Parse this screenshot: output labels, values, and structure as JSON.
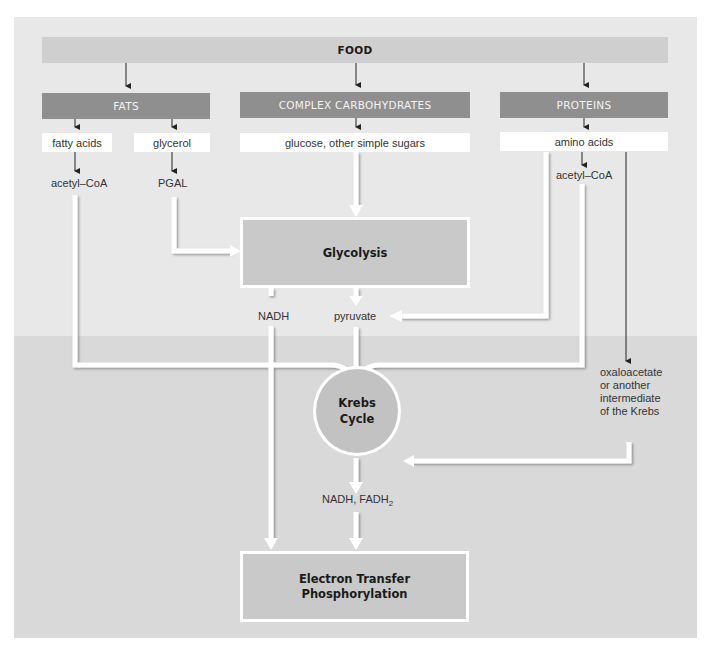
{
  "diagram": {
    "source": {
      "label": "FOOD"
    },
    "categories": [
      {
        "label": "FATS"
      },
      {
        "label": "COMPLEX CARBOHYDRATES"
      },
      {
        "label": "PROTEINS"
      }
    ],
    "breakdown_products": [
      {
        "label": "fatty acids"
      },
      {
        "label": "glycerol"
      },
      {
        "label": "glucose, other simple sugars"
      },
      {
        "label": "amino acids"
      }
    ],
    "intermediates": {
      "fat_acetyl_coa": "acetyl–CoA",
      "pgal": "PGAL",
      "protein_acetyl_coa": "acetyl–CoA",
      "nadh": "NADH",
      "pyruvate": "pyruvate",
      "oxaloacetate_lines": [
        "oxaloacetate",
        "or another",
        "intermediate",
        "of the Krebs"
      ],
      "nadh_fadh2_prefix": "NADH, FADH",
      "nadh_fadh2_sub": "2"
    },
    "processes": {
      "glycolysis": "Glycolysis",
      "krebs_line1": "Krebs",
      "krebs_line2": "Cycle",
      "etp_line1": "Electron Transfer",
      "etp_line2": "Phosphorylation"
    },
    "colors": {
      "panel_top": "#e8e8e8",
      "panel_bottom": "#d9d9d9",
      "food_bar": "#cfcfcf",
      "category_bar": "#8f8f8f",
      "process_box": "#c9c9c9",
      "arrow_white": "#ffffff",
      "arrow_thin": "#222222"
    }
  }
}
